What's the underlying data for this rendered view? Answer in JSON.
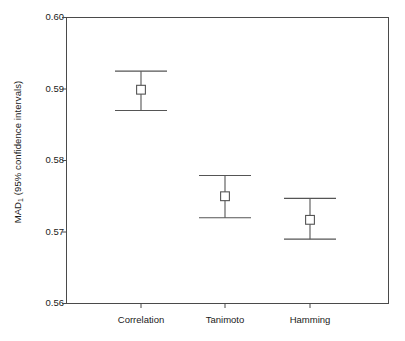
{
  "chart_data": {
    "type": "scatter",
    "title": "",
    "subtitle": "",
    "xlabel": "",
    "ylabel": "MAD1 (95% confidence intervals)",
    "ylabel_base": "MAD",
    "ylabel_sub": "1",
    "ylabel_rest": " (95% confidence intervals)",
    "categories": [
      "Correlation",
      "Tanimoto",
      "Hamming"
    ],
    "values": [
      0.5899,
      0.575,
      0.5717
    ],
    "error_low": [
      0.587,
      0.572,
      0.569
    ],
    "error_high": [
      0.5925,
      0.5779,
      0.5747
    ],
    "series": [
      {
        "name": "MAD1 mean with 95% CI",
        "points": [
          {
            "category": "Correlation",
            "mean": 0.5899,
            "ci_low": 0.587,
            "ci_high": 0.5925
          },
          {
            "category": "Tanimoto",
            "mean": 0.575,
            "ci_low": 0.572,
            "ci_high": 0.5779
          },
          {
            "category": "Hamming",
            "mean": 0.5717,
            "ci_low": 0.569,
            "ci_high": 0.5747
          }
        ]
      }
    ],
    "ylim": [
      0.56,
      0.6
    ],
    "yticks": [
      0.6,
      0.59,
      0.58,
      0.57,
      0.56
    ],
    "ytick_labels": [
      "0.60",
      "0.59",
      "0.58",
      "0.57",
      "0.56"
    ],
    "grid": false,
    "legend": false,
    "legend_position": "none",
    "marker": "open-square",
    "line_color": "#555555",
    "marker_color": "#555555",
    "axis_color": "#4a4a4a",
    "background_color": "#ffffff"
  },
  "axis": {
    "y_tick_0": "0.60",
    "y_tick_1": "0.59",
    "y_tick_2": "0.58",
    "y_tick_3": "0.57",
    "y_tick_4": "0.56",
    "x_tick_0": "Correlation",
    "x_tick_1": "Tanimoto",
    "x_tick_2": "Hamming"
  }
}
